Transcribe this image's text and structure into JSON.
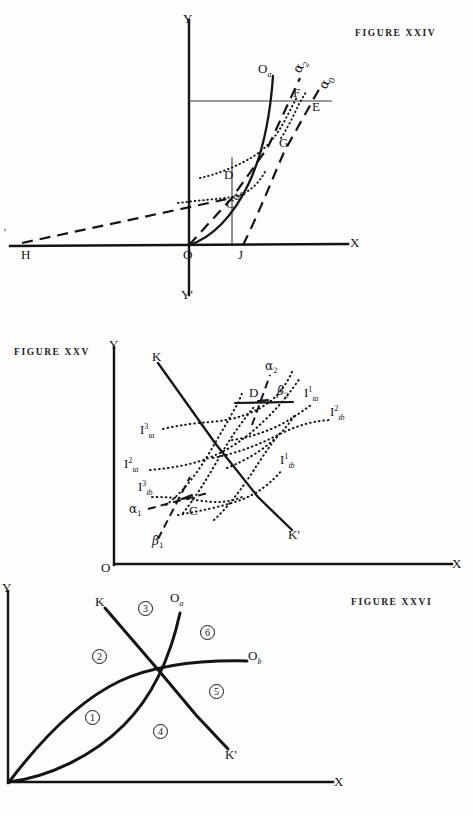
{
  "page": {
    "width": 473,
    "height": 816,
    "background": "#fefefe",
    "ink": "#141417"
  },
  "figures": [
    {
      "id": "figure-xxiv",
      "caption": "FIGURE XXIV",
      "axes": {
        "y_pos": "Y",
        "y_neg": "Y'",
        "x_pos": "X",
        "x_neg": "X'",
        "origin": "O"
      },
      "labels": [
        {
          "name": "curve-oa-label",
          "text": "O",
          "sub": "a"
        },
        {
          "name": "alpha2-label",
          "text": "α",
          "sub": "2"
        },
        {
          "name": "alpha0-label",
          "text": "α",
          "sub": "0"
        },
        {
          "name": "alpha1-label",
          "text": "α",
          "sub": "1"
        },
        {
          "name": "point-c-label",
          "text": "C"
        },
        {
          "name": "point-d-label",
          "text": "D"
        },
        {
          "name": "point-e-label",
          "text": "E"
        },
        {
          "name": "point-f-label",
          "text": "F"
        },
        {
          "name": "point-g-label",
          "text": "G"
        },
        {
          "name": "point-h-label",
          "text": "H"
        },
        {
          "name": "point-j-label",
          "text": "J"
        }
      ]
    },
    {
      "id": "figure-xxv",
      "caption": "FIGURE XXV",
      "axes": {
        "y_pos": "Y",
        "x_pos": "X",
        "origin": "O"
      },
      "labels": [
        {
          "name": "line-k-label",
          "text": "K"
        },
        {
          "name": "line-kprime-label",
          "text": "K'"
        },
        {
          "name": "point-c-label",
          "text": "C"
        },
        {
          "name": "point-d-label",
          "text": "D"
        },
        {
          "name": "alpha1-label",
          "text": "α",
          "sub": "1"
        },
        {
          "name": "alpha2-label",
          "text": "α",
          "sub": "2"
        },
        {
          "name": "beta1-label",
          "text": "β",
          "sub": "1"
        },
        {
          "name": "beta2-label",
          "text": "β",
          "sub": "2"
        },
        {
          "name": "indiff-ita-3",
          "text": "I",
          "sup": "3",
          "sub": "ta"
        },
        {
          "name": "indiff-ita-2",
          "text": "I",
          "sup": "2",
          "sub": "ta"
        },
        {
          "name": "indiff-itb-3",
          "text": "I",
          "sup": "3",
          "sub": "tb"
        },
        {
          "name": "indiff-ita-1",
          "text": "I",
          "sup": "1",
          "sub": "ta"
        },
        {
          "name": "indiff-itb-2",
          "text": "I",
          "sup": "2",
          "sub": "tb"
        },
        {
          "name": "indiff-itb-1",
          "text": "I",
          "sup": "1",
          "sub": "tb"
        }
      ]
    },
    {
      "id": "figure-xxvi",
      "caption": "FIGURE XXVI",
      "axes": {
        "y_pos": "Y",
        "x_pos": "X"
      },
      "labels": [
        {
          "name": "line-k-label",
          "text": "K"
        },
        {
          "name": "line-kprime-label",
          "text": "K'"
        },
        {
          "name": "curve-oa-label",
          "text": "O",
          "sub": "a"
        },
        {
          "name": "curve-ob-label",
          "text": "O",
          "sub": "b"
        }
      ],
      "regions": [
        "1",
        "2",
        "3",
        "4",
        "5",
        "6"
      ]
    }
  ],
  "fig24": {
    "caption": "FIGURE XXIV",
    "y_label": "Y",
    "yprime_label": "Y'",
    "x_label": "X",
    "xprime_label": "'",
    "o_label": "O",
    "oa_base": "O",
    "oa_sub": "a",
    "alpha2_base": "α",
    "alpha2_sub": "2",
    "alpha0_base": "α",
    "alpha0_sub": "0",
    "alpha1_base": "α",
    "alpha1_sub": "1",
    "c_label": "C",
    "d_label": "D",
    "e_label": "E",
    "f_label": "F",
    "g_label": "G",
    "h_label": "H",
    "j_label": "J"
  },
  "fig25": {
    "caption": "FIGURE XXV",
    "y_label": "Y",
    "x_label": "X",
    "o_label": "O",
    "k_label": "K",
    "kprime_label": "K'",
    "c_label": "C",
    "d_label": "D",
    "alpha1_base": "α",
    "alpha1_sub": "1",
    "alpha2_base": "α",
    "alpha2_sub": "2",
    "beta1_base": "β",
    "beta1_sub": "1",
    "beta2_base": "β",
    "beta2_sub": "2",
    "i_base": "I",
    "ita3_sup": "3",
    "ita3_sub": "ta",
    "ita2_sup": "2",
    "ita2_sub": "ta",
    "itb3_sup": "3",
    "itb3_sub": "tb",
    "ita1_sup": "1",
    "ita1_sub": "ta",
    "itb2_sup": "2",
    "itb2_sub": "tb",
    "itb1_sup": "1",
    "itb1_sub": "tb"
  },
  "fig26": {
    "caption": "FIGURE XXVI",
    "y_label": "Y",
    "x_label": "X",
    "k_label": "K",
    "kprime_label": "K'",
    "oa_base": "O",
    "oa_sub": "a",
    "ob_base": "O",
    "ob_sub": "b",
    "r1": "1",
    "r2": "2",
    "r3": "3",
    "r4": "4",
    "r5": "5",
    "r6": "6"
  }
}
